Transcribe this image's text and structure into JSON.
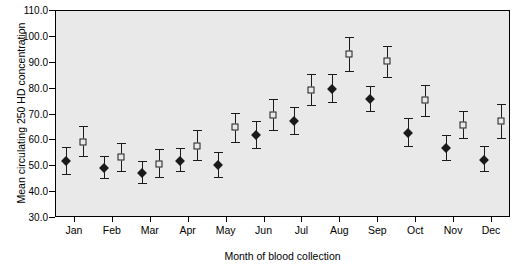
{
  "chart_data": {
    "type": "scatter",
    "title": "",
    "xlabel": "Month of blood collection",
    "ylabel": "Mean circulating 250 HD concentration",
    "ylim": [
      30.0,
      110.0
    ],
    "ytick_labels": [
      "30.0",
      "40.0",
      "50.0",
      "60.0",
      "70.0",
      "80.0",
      "90.0",
      "100.0",
      "110.0"
    ],
    "ytick_values": [
      30.0,
      40.0,
      50.0,
      60.0,
      70.0,
      80.0,
      90.0,
      100.0,
      110.0
    ],
    "grid": false,
    "legend": "none",
    "categories": [
      "Jan",
      "Feb",
      "Mar",
      "Apr",
      "May",
      "Jun",
      "Jul",
      "Aug",
      "Sep",
      "Oct",
      "Nov",
      "Dec"
    ],
    "series": [
      {
        "name": "Group 1",
        "marker": "filled-diamond",
        "color": "#1a1a1a",
        "values": [
          52.0,
          49.5,
          47.5,
          52.0,
          50.5,
          62.0,
          67.5,
          80.0,
          76.0,
          63.0,
          57.0,
          52.5
        ],
        "lower": [
          47.0,
          45.5,
          43.5,
          48.0,
          46.0,
          57.0,
          62.5,
          75.0,
          71.5,
          58.0,
          52.5,
          48.0
        ],
        "upper": [
          57.5,
          54.0,
          52.0,
          57.0,
          55.5,
          67.5,
          73.0,
          85.5,
          81.0,
          68.5,
          62.0,
          58.0
        ]
      },
      {
        "name": "Group 2",
        "marker": "open-square",
        "color": "#1a1a1a",
        "values": [
          59.5,
          53.5,
          51.0,
          58.0,
          65.0,
          70.0,
          79.5,
          93.5,
          90.5,
          75.5,
          66.0,
          67.5
        ],
        "lower": [
          54.0,
          48.0,
          46.0,
          52.5,
          59.5,
          64.0,
          73.5,
          87.0,
          84.5,
          69.5,
          61.0,
          61.0
        ],
        "upper": [
          65.5,
          59.0,
          56.5,
          64.0,
          70.5,
          76.0,
          85.5,
          100.0,
          96.5,
          81.5,
          71.5,
          74.0
        ]
      }
    ]
  }
}
